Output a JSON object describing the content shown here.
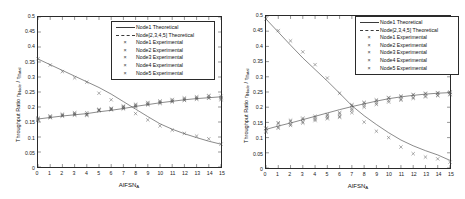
{
  "figure": {
    "background": "#ffffff",
    "axis_color": "#2a2a2a",
    "marker_color": "#555555"
  },
  "legend": {
    "entries": [
      {
        "label": "Node1 Theoretical",
        "key": "solid-line"
      },
      {
        "label": "Node[2,3,4,5] Theoretical",
        "key": "solid-line"
      },
      {
        "label": "Node1 Experimental",
        "key": "x-marker"
      },
      {
        "label": "Node2 Experimental",
        "key": "x-marker"
      },
      {
        "label": "Node3 Experimental",
        "key": "x-marker"
      },
      {
        "label": "Node4 Experimental",
        "key": "x-marker"
      },
      {
        "label": "Node5 Experimental",
        "key": "x-marker"
      }
    ]
  },
  "axes": {
    "xlabel_main": "AIFSN",
    "xlabel_sub": "A",
    "ylabel_main": "Throughput Ratio η",
    "ylabel_sub1": "Node",
    "ylabel_mid": " / η",
    "ylabel_sub2": "Total",
    "xticks": [
      "0",
      "1",
      "2",
      "3",
      "4",
      "5",
      "6",
      "7",
      "8",
      "9",
      "10",
      "11",
      "12",
      "13",
      "14",
      "15"
    ],
    "yticks": [
      "0",
      "0.05",
      "0.1",
      "0.15",
      "0.2",
      "0.25",
      "0.3",
      "0.35",
      "0.4",
      "0.45",
      "0.5"
    ],
    "xlim": [
      0,
      15
    ],
    "ylim": [
      0,
      0.5
    ]
  },
  "chart_data": [
    {
      "type": "line",
      "id": "left-panel",
      "title": "",
      "xlabel": "AIFSN_A",
      "ylabel": "Throughput Ratio η_Node / η_Total",
      "xlim": [
        0,
        15
      ],
      "ylim": [
        0,
        0.5
      ],
      "grid": false,
      "legend_position": "upper-right",
      "x": [
        0,
        1,
        2,
        3,
        4,
        5,
        6,
        7,
        8,
        9,
        10,
        11,
        12,
        13,
        14,
        15
      ],
      "series": [
        {
          "name": "Node1 Theoretical",
          "style": "line",
          "values": [
            0.36,
            0.341,
            0.322,
            0.303,
            0.284,
            0.265,
            0.243,
            0.218,
            0.193,
            0.168,
            0.144,
            0.126,
            0.111,
            0.098,
            0.086,
            0.076
          ]
        },
        {
          "name": "Node[2,3,4,5] Theoretical",
          "style": "line",
          "values": [
            0.16,
            0.165,
            0.17,
            0.174,
            0.178,
            0.184,
            0.189,
            0.195,
            0.202,
            0.208,
            0.214,
            0.219,
            0.224,
            0.228,
            0.231,
            0.234
          ]
        },
        {
          "name": "Node1 Experimental",
          "style": "x-marker",
          "values": [
            0.361,
            0.34,
            0.318,
            0.297,
            0.283,
            0.246,
            0.224,
            0.201,
            0.178,
            0.157,
            0.137,
            0.123,
            0.112,
            0.103,
            0.094,
            0.076
          ]
        },
        {
          "name": "Node2 Experimental",
          "style": "x-marker",
          "values": [
            0.16,
            0.168,
            0.173,
            0.178,
            0.176,
            0.19,
            0.194,
            0.199,
            0.206,
            0.212,
            0.217,
            0.222,
            0.227,
            0.231,
            0.236,
            0.231
          ]
        },
        {
          "name": "Node3 Experimental",
          "style": "x-marker",
          "values": [
            0.156,
            0.164,
            0.17,
            0.173,
            0.172,
            0.189,
            0.192,
            0.196,
            0.203,
            0.209,
            0.214,
            0.219,
            0.224,
            0.228,
            0.231,
            0.228
          ]
        },
        {
          "name": "Node4 Experimental",
          "style": "x-marker",
          "values": [
            0.163,
            0.17,
            0.176,
            0.181,
            0.181,
            0.192,
            0.196,
            0.203,
            0.209,
            0.215,
            0.22,
            0.225,
            0.23,
            0.234,
            0.238,
            0.236
          ]
        },
        {
          "name": "Node5 Experimental",
          "style": "x-marker",
          "values": [
            0.158,
            0.166,
            0.171,
            0.175,
            0.174,
            0.188,
            0.191,
            0.194,
            0.2,
            0.207,
            0.212,
            0.217,
            0.222,
            0.226,
            0.229,
            0.224
          ]
        }
      ]
    },
    {
      "type": "line",
      "id": "right-panel",
      "title": "",
      "xlabel": "AIFSN_A",
      "ylabel": "Throughput Ratio η_Node / η_Total",
      "xlim": [
        0,
        15
      ],
      "ylim": [
        0,
        0.5
      ],
      "grid": false,
      "legend_position": "upper-right",
      "x": [
        0,
        1,
        2,
        3,
        4,
        5,
        6,
        7,
        8,
        9,
        10,
        11,
        12,
        13,
        14,
        15
      ],
      "series": [
        {
          "name": "Node1 Theoretical",
          "style": "line",
          "values": [
            0.49,
            0.447,
            0.404,
            0.362,
            0.324,
            0.286,
            0.246,
            0.205,
            0.172,
            0.143,
            0.116,
            0.092,
            0.073,
            0.057,
            0.043,
            0.025
          ]
        },
        {
          "name": "Node[2,3,4,5] Theoretical",
          "style": "line",
          "values": [
            0.127,
            0.138,
            0.148,
            0.159,
            0.17,
            0.181,
            0.192,
            0.202,
            0.211,
            0.22,
            0.228,
            0.234,
            0.239,
            0.243,
            0.246,
            0.248
          ]
        },
        {
          "name": "Node1 Experimental",
          "style": "x-marker",
          "values": [
            0.49,
            0.452,
            0.418,
            0.382,
            0.34,
            0.296,
            0.246,
            0.182,
            0.151,
            0.121,
            0.1,
            0.069,
            0.047,
            0.036,
            0.03,
            0.019
          ]
        },
        {
          "name": "Node2 Experimental",
          "style": "x-marker",
          "values": [
            0.13,
            0.146,
            0.153,
            0.16,
            0.166,
            0.172,
            0.178,
            0.205,
            0.213,
            0.221,
            0.23,
            0.234,
            0.24,
            0.244,
            0.246,
            0.248
          ]
        },
        {
          "name": "Node3 Experimental",
          "style": "x-marker",
          "values": [
            0.122,
            0.135,
            0.144,
            0.152,
            0.16,
            0.166,
            0.17,
            0.196,
            0.206,
            0.214,
            0.222,
            0.227,
            0.232,
            0.237,
            0.24,
            0.243
          ]
        },
        {
          "name": "Node4 Experimental",
          "style": "x-marker",
          "values": [
            0.131,
            0.149,
            0.157,
            0.164,
            0.17,
            0.176,
            0.182,
            0.208,
            0.216,
            0.224,
            0.232,
            0.237,
            0.242,
            0.246,
            0.248,
            0.25
          ]
        },
        {
          "name": "Node5 Experimental",
          "style": "x-marker",
          "values": [
            0.118,
            0.131,
            0.14,
            0.148,
            0.156,
            0.162,
            0.167,
            0.19,
            0.2,
            0.209,
            0.217,
            0.223,
            0.229,
            0.234,
            0.238,
            0.241
          ]
        }
      ]
    }
  ]
}
